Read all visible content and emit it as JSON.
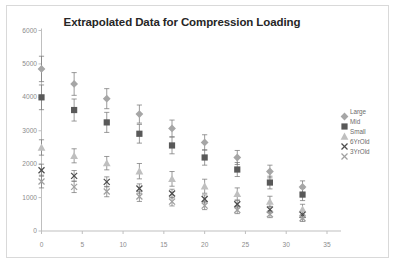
{
  "chart_data": {
    "type": "scatter",
    "title": "Extrapolated Data for Compression Loading",
    "xlabel": "",
    "ylabel": "",
    "xlim": [
      0,
      35
    ],
    "ylim": [
      0,
      6000
    ],
    "xticks": [
      0,
      5,
      10,
      15,
      20,
      25,
      30,
      35
    ],
    "yticks": [
      0,
      1000,
      2000,
      3000,
      4000,
      5000,
      6000
    ],
    "grid": false,
    "legend_position": "right",
    "errorbars": true,
    "x": [
      0,
      4,
      8,
      12,
      16,
      20,
      24,
      28,
      32
    ],
    "series": [
      {
        "name": "Large",
        "marker": "diamond",
        "color": "#a6a6a6",
        "values": [
          4850,
          4400,
          3960,
          3500,
          3070,
          2650,
          2200,
          1780,
          1320
        ],
        "err_up": [
          380,
          340,
          300,
          270,
          250,
          230,
          210,
          190,
          180
        ],
        "err_dn": [
          380,
          340,
          300,
          270,
          250,
          230,
          210,
          190,
          180
        ]
      },
      {
        "name": "Mid",
        "marker": "square",
        "color": "#595959",
        "values": [
          4000,
          3620,
          3250,
          2910,
          2560,
          2200,
          1840,
          1450,
          1090
        ],
        "err_up": [
          370,
          330,
          300,
          280,
          250,
          230,
          210,
          190,
          180
        ],
        "err_dn": [
          370,
          330,
          300,
          280,
          250,
          230,
          210,
          190,
          180
        ]
      },
      {
        "name": "Small",
        "marker": "triangle",
        "color": "#bfbfbf",
        "values": [
          2500,
          2250,
          2030,
          1790,
          1560,
          1340,
          1110,
          880,
          650
        ],
        "err_up": [
          230,
          210,
          200,
          230,
          220,
          210,
          180,
          160,
          150
        ],
        "err_dn": [
          230,
          210,
          200,
          230,
          220,
          210,
          180,
          160,
          150
        ]
      },
      {
        "name": "6YrOld",
        "marker": "cross",
        "color": "#4d4d4d",
        "values": [
          1820,
          1650,
          1470,
          1270,
          1120,
          960,
          800,
          640,
          490
        ],
        "err_up": [
          180,
          160,
          150,
          140,
          130,
          120,
          110,
          100,
          95
        ],
        "err_dn": [
          180,
          160,
          150,
          140,
          130,
          120,
          110,
          100,
          95
        ]
      },
      {
        "name": "3YrOld",
        "marker": "cross",
        "color": "#a0a0a0",
        "values": [
          1480,
          1320,
          1180,
          1030,
          880,
          760,
          630,
          500,
          380
        ],
        "err_up": [
          190,
          170,
          155,
          145,
          130,
          120,
          110,
          100,
          95
        ],
        "err_dn": [
          190,
          170,
          155,
          145,
          130,
          120,
          110,
          100,
          95
        ]
      }
    ]
  },
  "legend": {
    "items": [
      {
        "label": "Large",
        "marker": "diamond-marker-icon"
      },
      {
        "label": "Mid",
        "marker": "square-marker-icon"
      },
      {
        "label": "Small",
        "marker": "triangle-marker-icon"
      },
      {
        "label": "6YrOld",
        "marker": "cross-marker-icon"
      },
      {
        "label": "3YrOld",
        "marker": "cross-marker-icon"
      }
    ]
  },
  "axes": {
    "y_tick_labels": [
      "6000",
      "5000",
      "4000",
      "3000",
      "2000",
      "1000",
      "0"
    ],
    "x_tick_labels": [
      "0",
      "5",
      "10",
      "15",
      "20",
      "25",
      "30",
      "35"
    ]
  },
  "colors": {
    "axis": "#bfbfbf",
    "tick_text": "#8c8c8c",
    "title": "#262626",
    "border": "#d9d9d9",
    "background": "#ffffff"
  }
}
